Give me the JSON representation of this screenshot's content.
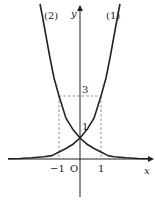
{
  "diagram": {
    "type": "function-graph",
    "x_axis_label": "x",
    "y_axis_label": "y",
    "origin_label": "O",
    "tick_labels": {
      "x_neg1": "−1",
      "x_pos1": "1",
      "y_1": "1",
      "y_3": "3"
    },
    "curves": [
      {
        "id": "curve-1",
        "label": "(1)",
        "function": "y = 3^x",
        "passes_through": [
          [
            0,
            1
          ],
          [
            1,
            3
          ]
        ]
      },
      {
        "id": "curve-2",
        "label": "(2)",
        "function": "y = 3^(-x)",
        "passes_through": [
          [
            0,
            1
          ],
          [
            -1,
            3
          ]
        ]
      }
    ],
    "guides": "dashed lines from x=-1 and x=1 up to y=3, and horizontal dashed line at y=3",
    "colors": {
      "curve": "#222222",
      "axis": "#222222",
      "dashed": "#777777"
    }
  }
}
